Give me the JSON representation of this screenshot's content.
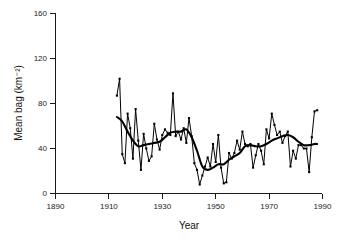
{
  "chart_data": {
    "type": "line",
    "title": "",
    "xlabel": "Year",
    "ylabel": "Mean bag (km⁻²)",
    "xlim": [
      1890,
      1990
    ],
    "ylim": [
      0,
      160
    ],
    "xticks": [
      1890,
      1910,
      1930,
      1950,
      1970,
      1990
    ],
    "yticks": [
      0,
      40,
      80,
      120,
      160
    ],
    "xtick_labels": [
      "1890",
      "1910",
      "1930",
      "1950",
      "1970",
      "1990"
    ],
    "ytick_labels": [
      "0",
      "40",
      "80",
      "120",
      "160"
    ],
    "grid": false,
    "legend": false,
    "legend_position": "none",
    "series": [
      {
        "name": "Annual mean bag",
        "style": "thin-line-with-markers",
        "x": [
          1913,
          1914,
          1915,
          1916,
          1917,
          1918,
          1919,
          1920,
          1921,
          1922,
          1923,
          1924,
          1925,
          1926,
          1927,
          1928,
          1929,
          1930,
          1931,
          1932,
          1933,
          1934,
          1935,
          1936,
          1937,
          1938,
          1939,
          1940,
          1941,
          1942,
          1943,
          1944,
          1945,
          1946,
          1947,
          1948,
          1949,
          1950,
          1951,
          1952,
          1953,
          1954,
          1955,
          1956,
          1957,
          1958,
          1959,
          1960,
          1961,
          1962,
          1963,
          1964,
          1965,
          1966,
          1967,
          1968,
          1969,
          1970,
          1971,
          1972,
          1973,
          1974,
          1975,
          1976,
          1977,
          1978,
          1979,
          1980,
          1981,
          1982,
          1983,
          1984,
          1985,
          1986,
          1987,
          1988
        ],
        "y": [
          87,
          102,
          35,
          27,
          71,
          58,
          31,
          75,
          47,
          21,
          53,
          40,
          29,
          33,
          62,
          48,
          39,
          52,
          57,
          54,
          52,
          89,
          51,
          55,
          48,
          58,
          45,
          67,
          51,
          27,
          21,
          8,
          16,
          24,
          32,
          24,
          44,
          28,
          52,
          23,
          9,
          10,
          36,
          31,
          36,
          47,
          39,
          55,
          44,
          42,
          44,
          23,
          34,
          44,
          38,
          26,
          57,
          49,
          71,
          61,
          52,
          55,
          45,
          51,
          55,
          24,
          38,
          31,
          43,
          43,
          40,
          40,
          19,
          50,
          73,
          74
        ],
        "marker": "square"
      },
      {
        "name": "Smoothed trend",
        "style": "thick-line",
        "x": [
          1913,
          1915,
          1917,
          1919,
          1921,
          1923,
          1925,
          1927,
          1929,
          1931,
          1933,
          1935,
          1937,
          1939,
          1941,
          1943,
          1945,
          1947,
          1949,
          1951,
          1953,
          1955,
          1957,
          1959,
          1961,
          1963,
          1965,
          1967,
          1969,
          1971,
          1973,
          1975,
          1977,
          1979,
          1981,
          1983,
          1985,
          1987,
          1988
        ],
        "y": [
          68,
          64,
          55,
          47,
          42,
          43,
          44,
          45,
          46,
          50,
          54,
          55,
          55,
          57,
          50,
          38,
          24,
          21,
          23,
          26,
          26,
          30,
          33,
          36,
          42,
          43,
          42,
          42,
          44,
          47,
          49,
          51,
          52,
          50,
          46,
          43,
          43,
          44,
          44
        ]
      }
    ]
  },
  "axes": {
    "x_axis_name": "year-axis",
    "y_axis_name": "mean-bag-axis"
  }
}
